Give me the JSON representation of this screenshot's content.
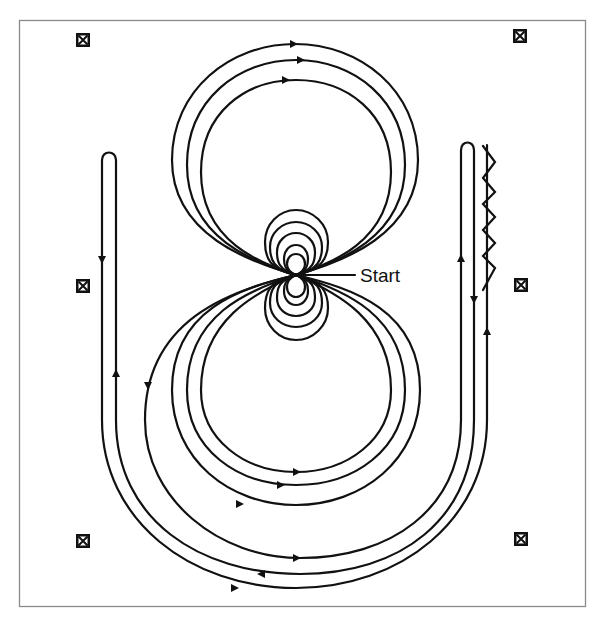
{
  "diagram": {
    "type": "flight-path / trajectory diagram",
    "start_label": "Start",
    "colors": {
      "line": "#111111",
      "frame": "#8a8a8a",
      "background": "#ffffff"
    },
    "markers": [
      {
        "id": "marker-top-left",
        "icon": "boxed-x-icon",
        "x": 83,
        "y": 40
      },
      {
        "id": "marker-top-right",
        "icon": "boxed-x-icon",
        "x": 520,
        "y": 36
      },
      {
        "id": "marker-mid-left",
        "icon": "boxed-x-icon",
        "x": 83,
        "y": 286
      },
      {
        "id": "marker-mid-right",
        "icon": "boxed-x-icon",
        "x": 521,
        "y": 285
      },
      {
        "id": "marker-bottom-left",
        "icon": "boxed-x-icon",
        "x": 83,
        "y": 541
      },
      {
        "id": "marker-bottom-right",
        "icon": "boxed-x-icon",
        "x": 521,
        "y": 539
      }
    ],
    "elements": [
      "upper large loops (3)",
      "lower large loops (3)",
      "upper small loops (5)",
      "lower small loops (5)",
      "left hairpin turn",
      "right hairpin turn",
      "right zigzag segment",
      "outer U-shaped sweeps (3)"
    ]
  }
}
